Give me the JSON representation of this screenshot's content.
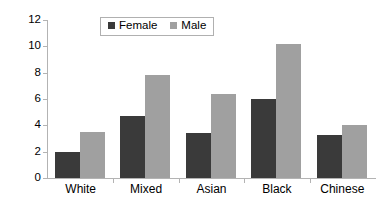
{
  "chart_data": {
    "type": "bar",
    "title": "",
    "xlabel": "",
    "ylabel": "",
    "categories": [
      "White",
      "Mixed",
      "Asian",
      "Black",
      "Chinese"
    ],
    "series": [
      {
        "name": "Female",
        "color": "#3a3a3a",
        "values": [
          2.0,
          4.7,
          3.4,
          6.0,
          3.3
        ]
      },
      {
        "name": "Male",
        "color": "#a0a0a0",
        "values": [
          3.5,
          7.85,
          6.4,
          10.2,
          4.0
        ]
      }
    ],
    "ylim": [
      0,
      12
    ],
    "yticks": [
      0,
      2,
      4,
      6,
      8,
      10,
      12
    ],
    "ytick_labels": [
      "0",
      "2",
      "4",
      "6",
      "8",
      "10",
      "12"
    ],
    "grid": false,
    "legend_position": "top-center",
    "axis_color": "#b3b3b3"
  },
  "legend": {
    "items": [
      {
        "label": "Female",
        "color": "#3a3a3a"
      },
      {
        "label": "Male",
        "color": "#a0a0a0"
      }
    ]
  }
}
